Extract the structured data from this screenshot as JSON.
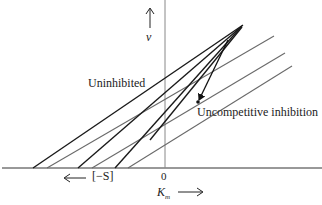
{
  "diagram": {
    "labels": {
      "uninhibited": "Uninhibited",
      "uncompetitive": "Uncompetitive inhibition",
      "y_axis": "v",
      "origin": "0",
      "neg_s": "[−S]",
      "x_axis": "K",
      "x_axis_sub": "m"
    },
    "arrows": {
      "y_up": "up-arrow",
      "neg_s_left": "left-arrow",
      "km_right": "right-arrow",
      "shift_arrow": "down-left-arrow"
    },
    "colors": {
      "uninhibited_lines": "#1a1a1a",
      "inhibited_lines": "#6a6a6a",
      "axes": "#333333"
    },
    "uninhibited_lines": [
      {
        "x_intercept_px": 33
      },
      {
        "x_intercept_px": 78
      },
      {
        "x_intercept_px": 115
      }
    ],
    "inhibited_lines": [
      {
        "x_intercept_px": 47
      },
      {
        "x_intercept_px": 92
      },
      {
        "x_intercept_px": 128
      }
    ],
    "convergence_points": {
      "uninhibited": [
        228,
        40
      ],
      "uncompetitive": [
        198,
        102
      ]
    }
  }
}
